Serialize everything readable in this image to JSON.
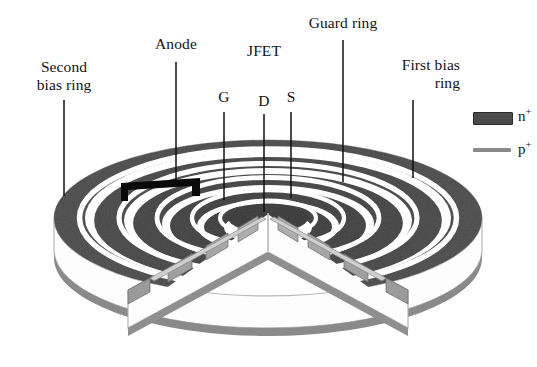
{
  "figure": {
    "title_alt": "Cutaway 3D view of a circular silicon drift detector with concentric rings",
    "labels": [
      {
        "id": "second-bias-ring",
        "text": "Second\nbias ring",
        "x": 12,
        "y": 58,
        "w": 104,
        "align": "center",
        "leader": {
          "x1": 64,
          "y1": 100,
          "x2": 64,
          "y2": 196
        }
      },
      {
        "id": "anode",
        "text": "Anode",
        "x": 140,
        "y": 35,
        "w": 72,
        "align": "center",
        "leader": {
          "x1": 176,
          "y1": 62,
          "x2": 176,
          "y2": 182
        }
      },
      {
        "id": "jfet",
        "text": "JFET",
        "x": 238,
        "y": 42,
        "w": 52,
        "align": "center",
        "leader": null
      },
      {
        "id": "gate",
        "text": "G",
        "x": 212,
        "y": 88,
        "w": 24,
        "align": "center",
        "leader": {
          "x1": 224,
          "y1": 112,
          "x2": 224,
          "y2": 200
        }
      },
      {
        "id": "drain",
        "text": "D",
        "x": 252,
        "y": 92,
        "w": 24,
        "align": "center",
        "leader": {
          "x1": 264,
          "y1": 114,
          "x2": 264,
          "y2": 212
        }
      },
      {
        "id": "source",
        "text": "S",
        "x": 280,
        "y": 88,
        "w": 22,
        "align": "center",
        "leader": {
          "x1": 291,
          "y1": 112,
          "x2": 291,
          "y2": 198
        }
      },
      {
        "id": "guard-ring",
        "text": "Guard ring",
        "x": 288,
        "y": 14,
        "w": 110,
        "align": "center",
        "leader": {
          "x1": 343,
          "y1": 40,
          "x2": 343,
          "y2": 182
        }
      },
      {
        "id": "first-bias-ring",
        "text": "First bias\nring",
        "x": 374,
        "y": 56,
        "w": 86,
        "align": "right",
        "leader": {
          "x1": 413,
          "y1": 100,
          "x2": 413,
          "y2": 178
        }
      }
    ],
    "legend": {
      "items": [
        {
          "id": "n-plus",
          "symbol": "filled-rect",
          "label_base": "n",
          "label_sup": "+",
          "color": "#4a4a4a"
        },
        {
          "id": "p-plus",
          "symbol": "line",
          "label_base": "p",
          "label_sup": "+",
          "color": "#8a8a8a"
        }
      ]
    },
    "colors": {
      "n_plus_ring": "#585858",
      "n_plus_ring_dark": "#4b4b4b",
      "p_plus_layer": "#8a8a8a",
      "bulk_side": "#fdfdfd",
      "cut_face": "#c9c9c9",
      "gap": "#ffffff",
      "anode_metal": "#0a0a0a",
      "outline": "#9a9a9a",
      "leader": "#111111"
    },
    "geometry": {
      "disc_center_x": 268,
      "disc_center_y": 218,
      "disc_rx": 214,
      "disc_ry": 78,
      "body_thickness": 62,
      "ring_count": 6,
      "wedge_half_angle_deg": 46
    }
  }
}
